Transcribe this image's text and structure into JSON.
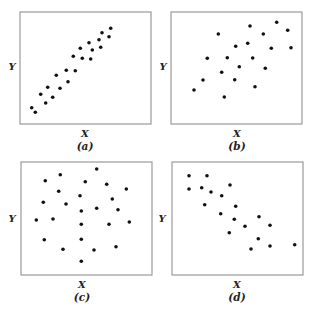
{
  "chart_data": [
    {
      "type": "scatter",
      "panel": "a",
      "caption": "(a)",
      "xlabel": "X",
      "ylabel": "Y",
      "title": "",
      "grid": false,
      "ticks": false,
      "description": "strong positive correlation",
      "box": {
        "x": 20,
        "y": 12,
        "w": 131,
        "h": 112
      },
      "points": [
        [
          11.7,
          95.7
        ],
        [
          15.3,
          100.3
        ],
        [
          20.7,
          82.3
        ],
        [
          25.7,
          91
        ],
        [
          27.7,
          75.3
        ],
        [
          32.7,
          85.3
        ],
        [
          36.3,
          63.3
        ],
        [
          40,
          76.3
        ],
        [
          46.3,
          58.3
        ],
        [
          48,
          69.7
        ],
        [
          53.3,
          44.3
        ],
        [
          55.3,
          58.7
        ],
        [
          60.3,
          36.3
        ],
        [
          62.3,
          46.3
        ],
        [
          69,
          30.7
        ],
        [
          70.7,
          47
        ],
        [
          72.3,
          38
        ],
        [
          79,
          27.7
        ],
        [
          80.7,
          35.3
        ],
        [
          82,
          20.7
        ],
        [
          89,
          24.7
        ],
        [
          90.7,
          16.3
        ]
      ]
    },
    {
      "type": "scatter",
      "panel": "b",
      "caption": "(b)",
      "xlabel": "X",
      "ylabel": "Y",
      "title": "",
      "grid": false,
      "ticks": false,
      "description": "moderate positive correlation",
      "box": {
        "x": 171,
        "y": 12,
        "w": 131,
        "h": 112
      },
      "points": [
        [
          23,
          78
        ],
        [
          32,
          68
        ],
        [
          36.3,
          46.3
        ],
        [
          47.3,
          22
        ],
        [
          50.7,
          60.3
        ],
        [
          53.3,
          85
        ],
        [
          56.3,
          45.7
        ],
        [
          63.7,
          67.7
        ],
        [
          64.7,
          34.3
        ],
        [
          68.3,
          54.7
        ],
        [
          76.7,
          31.3
        ],
        [
          79,
          14
        ],
        [
          81.7,
          46
        ],
        [
          84,
          74.7
        ],
        [
          92.3,
          22
        ],
        [
          94.3,
          56.3
        ],
        [
          100.3,
          36.3
        ],
        [
          105.7,
          10.3
        ],
        [
          116.7,
          18.3
        ],
        [
          120,
          35.7
        ]
      ]
    },
    {
      "type": "scatter",
      "panel": "c",
      "caption": "(c)",
      "xlabel": "X",
      "ylabel": "Y",
      "title": "",
      "grid": false,
      "ticks": false,
      "description": "no correlation",
      "box": {
        "x": 21,
        "y": 162,
        "w": 131,
        "h": 113
      },
      "points": [
        [
          15.3,
          58
        ],
        [
          22.3,
          40.3
        ],
        [
          23.3,
          77.7
        ],
        [
          24.3,
          18.7
        ],
        [
          32,
          57
        ],
        [
          37.7,
          29.3
        ],
        [
          39.3,
          12.7
        ],
        [
          42,
          87.3
        ],
        [
          45,
          42
        ],
        [
          59,
          33.7
        ],
        [
          60.3,
          49
        ],
        [
          60.3,
          62.3
        ],
        [
          60.3,
          77.3
        ],
        [
          60.3,
          99.3
        ],
        [
          64.3,
          19.7
        ],
        [
          73,
          88
        ],
        [
          75.7,
          7
        ],
        [
          75.7,
          46.3
        ],
        [
          85.7,
          22.3
        ],
        [
          88,
          62.3
        ],
        [
          91.3,
          37
        ],
        [
          95,
          84.7
        ],
        [
          97,
          47.7
        ],
        [
          105.3,
          27
        ],
        [
          108.3,
          60
        ]
      ]
    },
    {
      "type": "scatter",
      "panel": "d",
      "caption": "(d)",
      "xlabel": "X",
      "ylabel": "Y",
      "title": "",
      "grid": false,
      "ticks": false,
      "description": "negative correlation",
      "box": {
        "x": 172,
        "y": 162,
        "w": 131,
        "h": 113
      },
      "points": [
        [
          17,
          13.7
        ],
        [
          17,
          27
        ],
        [
          29.7,
          25.7
        ],
        [
          32.7,
          42.7
        ],
        [
          35,
          13.7
        ],
        [
          39,
          30
        ],
        [
          48.7,
          51.7
        ],
        [
          49.7,
          33.7
        ],
        [
          57.3,
          70.7
        ],
        [
          58,
          23
        ],
        [
          62.3,
          57.3
        ],
        [
          63.7,
          44.3
        ],
        [
          73,
          64.3
        ],
        [
          79,
          87
        ],
        [
          86.3,
          76.7
        ],
        [
          87,
          54.7
        ],
        [
          98,
          63.3
        ],
        [
          98,
          84
        ],
        [
          122.7,
          82.7
        ]
      ]
    }
  ],
  "panels": {
    "a": {
      "xlabel": "X",
      "ylabel": "Y",
      "caption": "(a)"
    },
    "b": {
      "xlabel": "X",
      "ylabel": "Y",
      "caption": "(b)"
    },
    "c": {
      "xlabel": "X",
      "ylabel": "Y",
      "caption": "(c)"
    },
    "d": {
      "xlabel": "X",
      "ylabel": "Y",
      "caption": "(d)"
    }
  },
  "colors": {
    "dot": "#111111",
    "frame": "#9a9a9a",
    "text": "#222222"
  }
}
